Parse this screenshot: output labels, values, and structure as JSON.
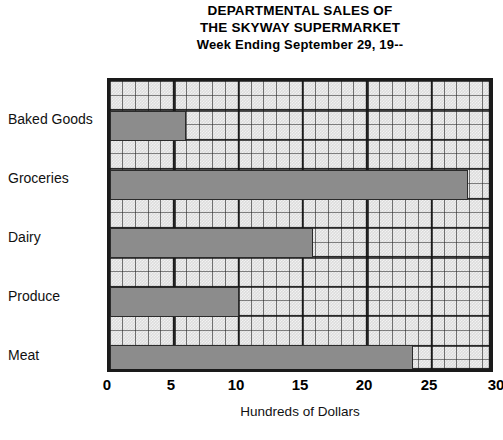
{
  "chart_data": {
    "type": "bar",
    "orientation": "horizontal",
    "title": "DEPARTMENTAL SALES OF THE SKYWAY SUPERMARKET Week Ending September 29, 19--",
    "title_lines": [
      "DEPARTMENTAL SALES OF",
      "THE SKYWAY SUPERMARKET",
      "Week Ending September 29, 19--"
    ],
    "categories": [
      "Baked Goods",
      "Groceries",
      "Dairy",
      "Produce",
      "Meat"
    ],
    "values": [
      6.0,
      28.3,
      16.0,
      10.2,
      23.9
    ],
    "xlabel": "Hundreds of Dollars",
    "ylabel": "",
    "xlim": [
      0,
      30
    ],
    "xticks": [
      0,
      5,
      10,
      15,
      20,
      25,
      30
    ],
    "xtick_labels": [
      "0",
      "5",
      "10",
      "15",
      "20",
      "25",
      "30"
    ],
    "grid": true,
    "grid_style": "graph-paper, minor every 1 unit, major every 5 units",
    "legend": null,
    "bar_color": "#8c8c8c",
    "bar_edge_color": "#2b2b2b",
    "plot_background": "#dcdcdc",
    "axis_color": "#1a1a1a",
    "note": "Rightmost tick label 30 is clipped by the image edge"
  }
}
